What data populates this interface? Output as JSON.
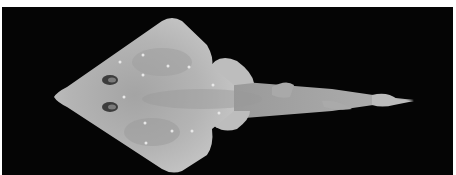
{
  "image": {
    "subject": "guitarfish (shovelnose ray), dorsal view",
    "background_color": "#050505",
    "border_color": "#ffffff",
    "body_color": "#b9b9b9"
  }
}
